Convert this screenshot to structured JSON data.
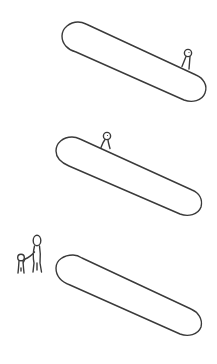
{
  "scene": {
    "description": "Hand-drawn line sketch of three tilted pill-shaped slabs with small stick figures",
    "stroke_color": "#3a3a3a",
    "background_color": "#ffffff",
    "panels": [
      {
        "id": "panel-1",
        "shape": "tilted-pill",
        "figures": [
          {
            "type": "single-small-figure",
            "position": "standing on upper-right edge of pill"
          }
        ]
      },
      {
        "id": "panel-2",
        "shape": "tilted-pill",
        "figures": [
          {
            "type": "single-small-figure",
            "position": "standing on upper-left edge of pill"
          }
        ]
      },
      {
        "id": "panel-3",
        "shape": "tilted-pill",
        "figures": [
          {
            "type": "adult-figure",
            "position": "left of pill, holding hands with child"
          },
          {
            "type": "child-figure",
            "position": "left of adult"
          }
        ]
      }
    ]
  }
}
